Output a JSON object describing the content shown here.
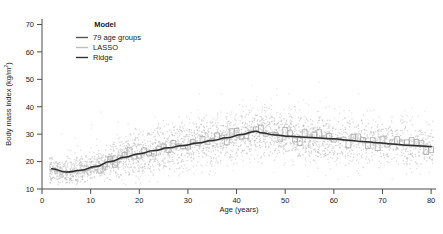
{
  "chart_data": {
    "type": "scatter",
    "title": "",
    "xlabel": "Age (years)",
    "ylabel": "Body mass index (kg/m²)",
    "ylabel_main": "Body mass index (kg/m",
    "ylabel_sup": "2",
    "ylabel_tail": ")",
    "xlim": [
      0,
      81
    ],
    "ylim": [
      10,
      72
    ],
    "xticks": [
      0,
      10,
      20,
      30,
      40,
      50,
      60,
      70,
      80
    ],
    "yticks": [
      10,
      20,
      30,
      40,
      50,
      60,
      70
    ],
    "grid": false,
    "legend_position": "top-left-inside",
    "legend_title": "Model",
    "colors": {
      "scatter_point": "#c9c9c9",
      "step_79_age_groups": "#9a9a9a",
      "lasso": "#b5b5b5",
      "ridge": "#333333",
      "axis": "#4d4d4d",
      "background": "#ffffff"
    },
    "legend": [
      {
        "label": "79 age groups",
        "color": "#555555",
        "style": "step"
      },
      {
        "label": "LASSO",
        "color": "#b5b5b5",
        "style": "line"
      },
      {
        "label": "Ridge",
        "color": "#333333",
        "style": "line"
      }
    ],
    "series": [
      {
        "name": "79 age groups",
        "type": "step",
        "x": [
          2,
          3,
          4,
          5,
          6,
          7,
          8,
          9,
          10,
          11,
          12,
          13,
          14,
          15,
          16,
          17,
          18,
          19,
          20,
          21,
          22,
          23,
          24,
          25,
          26,
          27,
          28,
          29,
          30,
          31,
          32,
          33,
          34,
          35,
          36,
          37,
          38,
          39,
          40,
          41,
          42,
          43,
          44,
          45,
          46,
          47,
          48,
          49,
          50,
          51,
          52,
          53,
          54,
          55,
          56,
          57,
          58,
          59,
          60,
          61,
          62,
          63,
          64,
          65,
          66,
          67,
          68,
          69,
          70,
          71,
          72,
          73,
          74,
          75,
          76,
          77,
          78,
          79,
          80
        ],
        "values": [
          17.2,
          16.6,
          16.2,
          16.0,
          16.1,
          16.3,
          16.6,
          17.0,
          17.5,
          18.0,
          18.6,
          19.2,
          19.8,
          20.4,
          20.9,
          21.4,
          21.9,
          22.3,
          22.7,
          23.1,
          23.5,
          23.9,
          24.2,
          24.6,
          24.9,
          25.2,
          25.5,
          25.8,
          26.1,
          26.4,
          26.7,
          27.0,
          27.3,
          27.6,
          27.9,
          28.2,
          28.6,
          29.0,
          29.4,
          29.8,
          30.2,
          30.6,
          31.1,
          30.6,
          30.2,
          29.9,
          29.7,
          29.5,
          29.3,
          29.1,
          29.0,
          28.9,
          28.8,
          28.7,
          28.6,
          28.5,
          28.4,
          28.3,
          28.2,
          28.0,
          27.9,
          27.7,
          27.6,
          27.4,
          27.2,
          27.1,
          26.9,
          26.8,
          26.6,
          26.5,
          26.3,
          26.2,
          26.0,
          25.9,
          25.8,
          25.7,
          25.6,
          25.5,
          25.4
        ]
      },
      {
        "name": "LASSO",
        "type": "line",
        "x": [
          2,
          5,
          8,
          11,
          14,
          17,
          20,
          23,
          26,
          29,
          32,
          35,
          38,
          41,
          44,
          45,
          48,
          51,
          54,
          57,
          60,
          63,
          66,
          69,
          72,
          75,
          78,
          80
        ],
        "values": [
          17.3,
          16.1,
          16.7,
          18.1,
          19.9,
          21.5,
          22.8,
          23.9,
          24.9,
          25.8,
          26.7,
          27.6,
          28.6,
          29.8,
          31.0,
          30.4,
          29.6,
          29.1,
          28.8,
          28.5,
          28.2,
          27.7,
          27.2,
          26.8,
          26.3,
          25.9,
          25.6,
          25.4
        ]
      },
      {
        "name": "Ridge",
        "type": "line",
        "x": [
          2,
          5,
          8,
          11,
          14,
          17,
          20,
          23,
          26,
          29,
          32,
          35,
          38,
          41,
          44,
          45,
          48,
          51,
          54,
          57,
          60,
          63,
          66,
          69,
          72,
          75,
          78,
          80
        ],
        "values": [
          17.4,
          16.2,
          16.8,
          18.2,
          20.0,
          21.6,
          22.9,
          24.0,
          25.0,
          25.9,
          26.8,
          27.7,
          28.7,
          29.9,
          31.1,
          30.5,
          29.7,
          29.2,
          28.9,
          28.6,
          28.3,
          27.8,
          27.3,
          26.9,
          26.4,
          26.0,
          25.7,
          25.5
        ]
      }
    ],
    "scatter_note": "dense light-grey point cloud of individual observations, BMI 12-58, age 2-80"
  }
}
